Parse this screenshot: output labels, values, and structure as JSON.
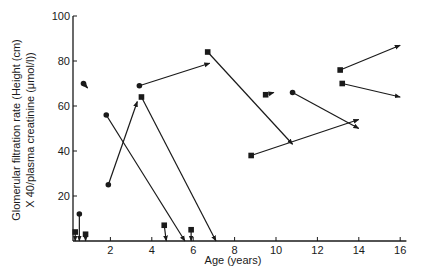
{
  "chart_data": {
    "type": "line",
    "title": "",
    "xlabel": "Age (years)",
    "ylabel_line1": "Glomerular filtration rate (Height (cm)",
    "ylabel_line2": "X 40/plasma creatinine (μmol/l))",
    "xlim": [
      0,
      16
    ],
    "ylim": [
      0,
      100
    ],
    "x_ticks": [
      2,
      4,
      6,
      8,
      10,
      12,
      14,
      16
    ],
    "y_ticks": [
      20,
      40,
      60,
      80,
      100
    ],
    "grid": false,
    "legend": null,
    "series_description": "Each segment shows one patient's GFR change from start (circle or square marker) to end (arrowhead)",
    "segments": [
      {
        "start_marker": "circle",
        "x": [
          0.5,
          0.5
        ],
        "y": [
          12,
          0
        ]
      },
      {
        "start_marker": "square",
        "x": [
          0.3,
          0.3
        ],
        "y": [
          4,
          0
        ]
      },
      {
        "start_marker": "square",
        "x": [
          0.8,
          0.8
        ],
        "y": [
          3,
          0
        ]
      },
      {
        "start_marker": "circle",
        "x": [
          0.7,
          0.9
        ],
        "y": [
          70,
          68
        ]
      },
      {
        "start_marker": "circle",
        "x": [
          1.8,
          5.6
        ],
        "y": [
          56,
          0
        ]
      },
      {
        "start_marker": "circle",
        "x": [
          1.9,
          3.3
        ],
        "y": [
          25,
          62
        ]
      },
      {
        "start_marker": "circle",
        "x": [
          3.4,
          6.8
        ],
        "y": [
          69,
          79
        ]
      },
      {
        "start_marker": "square",
        "x": [
          3.5,
          7.1
        ],
        "y": [
          64,
          0
        ]
      },
      {
        "start_marker": "square",
        "x": [
          4.6,
          4.7
        ],
        "y": [
          7,
          0
        ]
      },
      {
        "start_marker": "square",
        "x": [
          5.9,
          5.9
        ],
        "y": [
          5,
          0
        ]
      },
      {
        "start_marker": "square",
        "x": [
          6.7,
          10.8
        ],
        "y": [
          84,
          43
        ]
      },
      {
        "start_marker": "square",
        "x": [
          8.8,
          14.0
        ],
        "y": [
          38,
          54
        ]
      },
      {
        "start_marker": "square",
        "x": [
          9.5,
          9.9
        ],
        "y": [
          65,
          66
        ]
      },
      {
        "start_marker": "circle",
        "x": [
          10.8,
          14.0
        ],
        "y": [
          66,
          50
        ]
      },
      {
        "start_marker": "square",
        "x": [
          13.1,
          16.0
        ],
        "y": [
          76,
          87
        ]
      },
      {
        "start_marker": "square",
        "x": [
          13.2,
          16.0
        ],
        "y": [
          70,
          64
        ]
      }
    ]
  }
}
